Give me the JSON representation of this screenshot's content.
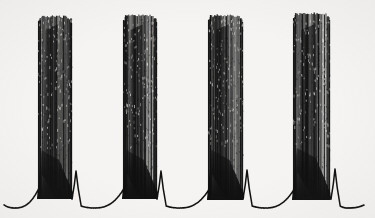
{
  "figure": {
    "title": "",
    "kind": "electrophysiology-trace",
    "description": "Intracellular membrane potential recording showing rhythmic bursting: four high-frequency spike bursts riding on slow depolarizing envelopes, separated by interburst intervals containing a single small post-burst spikelet on a slowly depolarizing ramp.",
    "background_color": "#f6f5f3",
    "trace_color": "#111111",
    "width": 375,
    "height": 218
  },
  "chart_data": {
    "type": "line",
    "title": "",
    "subtitle": "",
    "xlabel": "",
    "ylabel": "",
    "xlim": [
      0,
      375
    ],
    "ylim": [
      218,
      0
    ],
    "grid": false,
    "legend": null,
    "axes_visible": false,
    "tick_labels_x": [],
    "tick_labels_y": [],
    "annotations": [],
    "baseline_y": 205,
    "spike_peak_y": 14,
    "series": [
      {
        "name": "membrane-potential",
        "color": "#111111",
        "line_width": 1.0,
        "trace_start_x": 4,
        "trace_end_x": 364
      }
    ],
    "bursts": [
      {
        "index": 1,
        "start_x": 38,
        "end_x": 72,
        "spike_count": 26,
        "peak_top_y": 15,
        "envelope_base_y": 196,
        "envelope_shoulder_y": 150,
        "ramp_start_x": 10,
        "ramp_min_y": 208
      },
      {
        "index": 2,
        "start_x": 123,
        "end_x": 157,
        "spike_count": 26,
        "peak_top_y": 14,
        "envelope_base_y": 196,
        "envelope_shoulder_y": 150,
        "ramp_start_x": 95,
        "ramp_min_y": 208
      },
      {
        "index": 3,
        "start_x": 208,
        "end_x": 243,
        "spike_count": 27,
        "peak_top_y": 14,
        "envelope_base_y": 197,
        "envelope_shoulder_y": 150,
        "ramp_start_x": 180,
        "ramp_min_y": 208
      },
      {
        "index": 4,
        "start_x": 293,
        "end_x": 330,
        "spike_count": 28,
        "peak_top_y": 12,
        "envelope_base_y": 197,
        "envelope_shoulder_y": 148,
        "ramp_start_x": 265,
        "ramp_min_y": 208
      }
    ],
    "post_burst_spikelets": [
      {
        "x": 76,
        "peak_y": 171,
        "half_width": 4
      },
      {
        "x": 161,
        "peak_y": 171,
        "half_width": 4
      },
      {
        "x": 247,
        "peak_y": 170,
        "half_width": 4
      },
      {
        "x": 335,
        "peak_y": 169,
        "half_width": 4
      }
    ],
    "interburst_intervals_px": [
      85,
      85,
      85
    ]
  }
}
